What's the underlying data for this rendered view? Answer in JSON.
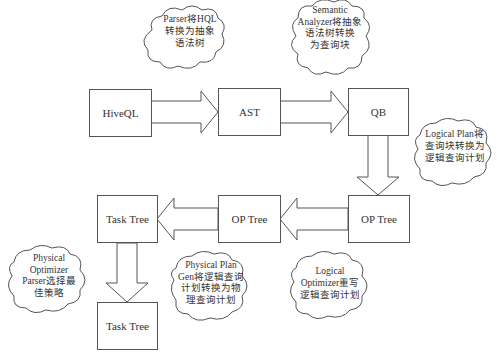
{
  "diagram": {
    "nodes": [
      {
        "id": "hiveql",
        "label": "HiveQL"
      },
      {
        "id": "ast",
        "label": "AST"
      },
      {
        "id": "qb",
        "label": "QB"
      },
      {
        "id": "op_tree_right",
        "label": "OP Tree"
      },
      {
        "id": "op_tree_mid",
        "label": "OP Tree"
      },
      {
        "id": "task_tree_top",
        "label": "Task Tree"
      },
      {
        "id": "task_tree_bottom",
        "label": "Task Tree"
      }
    ],
    "edges": [
      {
        "from": "hiveql",
        "to": "ast"
      },
      {
        "from": "ast",
        "to": "qb"
      },
      {
        "from": "qb",
        "to": "op_tree_right"
      },
      {
        "from": "op_tree_right",
        "to": "op_tree_mid"
      },
      {
        "from": "op_tree_mid",
        "to": "task_tree_top"
      },
      {
        "from": "task_tree_top",
        "to": "task_tree_bottom"
      }
    ],
    "annotations": [
      {
        "id": "parser",
        "text": "Parser将HQL\n转换为抽象\n语法树"
      },
      {
        "id": "semantic_analyzer",
        "text": "Semantic\nAnalyzer将抽象\n语法树转换\n为查询块"
      },
      {
        "id": "logical_plan",
        "text": "Logical Plan将\n查询块转换为\n逻辑查询计划"
      },
      {
        "id": "logical_optimizer",
        "text": "Logical\nOptimizer重写\n逻辑查询计划"
      },
      {
        "id": "physical_plan_gen",
        "text": "Physical Plan\nGen将逻辑查询\n计划转换为物\n理查询计划"
      },
      {
        "id": "physical_optimizer",
        "text": "Physical\nOptimizer\nParser选择最\n佳策略"
      }
    ]
  }
}
